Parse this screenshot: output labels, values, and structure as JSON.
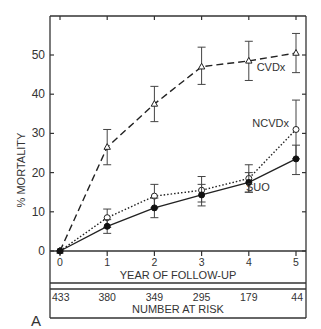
{
  "chart_data": {
    "type": "line",
    "title": "",
    "panel_label": "A",
    "xlabel": "YEAR OF FOLLOW-UP",
    "ylabel": "% MORTALITY",
    "x": [
      0,
      1,
      2,
      3,
      4,
      5
    ],
    "x_tick_labels": [
      "0",
      "1",
      "2",
      "3",
      "4",
      "5"
    ],
    "y_tick_labels": [
      "0",
      "10",
      "20",
      "30",
      "40",
      "50"
    ],
    "ylim": [
      0,
      60
    ],
    "xlim": [
      -0.2,
      5.2
    ],
    "grid": false,
    "legend_position": "inline labels",
    "series": [
      {
        "name": "CVDx",
        "style": "dashed",
        "marker": "open-triangle",
        "values": [
          0,
          26.5,
          37.5,
          47.0,
          48.5,
          50.5
        ],
        "err_low": [
          0,
          22.0,
          33.0,
          42.5,
          43.5,
          45.5
        ],
        "err_high": [
          0,
          31.0,
          42.0,
          52.0,
          53.5,
          55.5
        ]
      },
      {
        "name": "NCVDx",
        "style": "dotted",
        "marker": "open-circle",
        "values": [
          0,
          8.5,
          14.0,
          15.5,
          18.5,
          31.0
        ],
        "err_low": [
          0,
          6.0,
          11.0,
          12.5,
          15.0,
          23.5
        ],
        "err_high": [
          0,
          10.7,
          17.0,
          19.0,
          22.0,
          38.5
        ]
      },
      {
        "name": "SUO",
        "style": "solid",
        "marker": "filled-circle",
        "values": [
          0,
          6.3,
          11.0,
          14.3,
          17.5,
          23.5
        ],
        "err_low": [
          0,
          4.5,
          8.5,
          11.5,
          15.0,
          19.5
        ],
        "err_high": [
          0,
          8.0,
          13.5,
          17.0,
          20.0,
          27.0
        ]
      }
    ],
    "number_at_risk": {
      "label": "NUMBER AT RISK",
      "values": [
        "433",
        "380",
        "349",
        "295",
        "179",
        "44"
      ]
    }
  }
}
